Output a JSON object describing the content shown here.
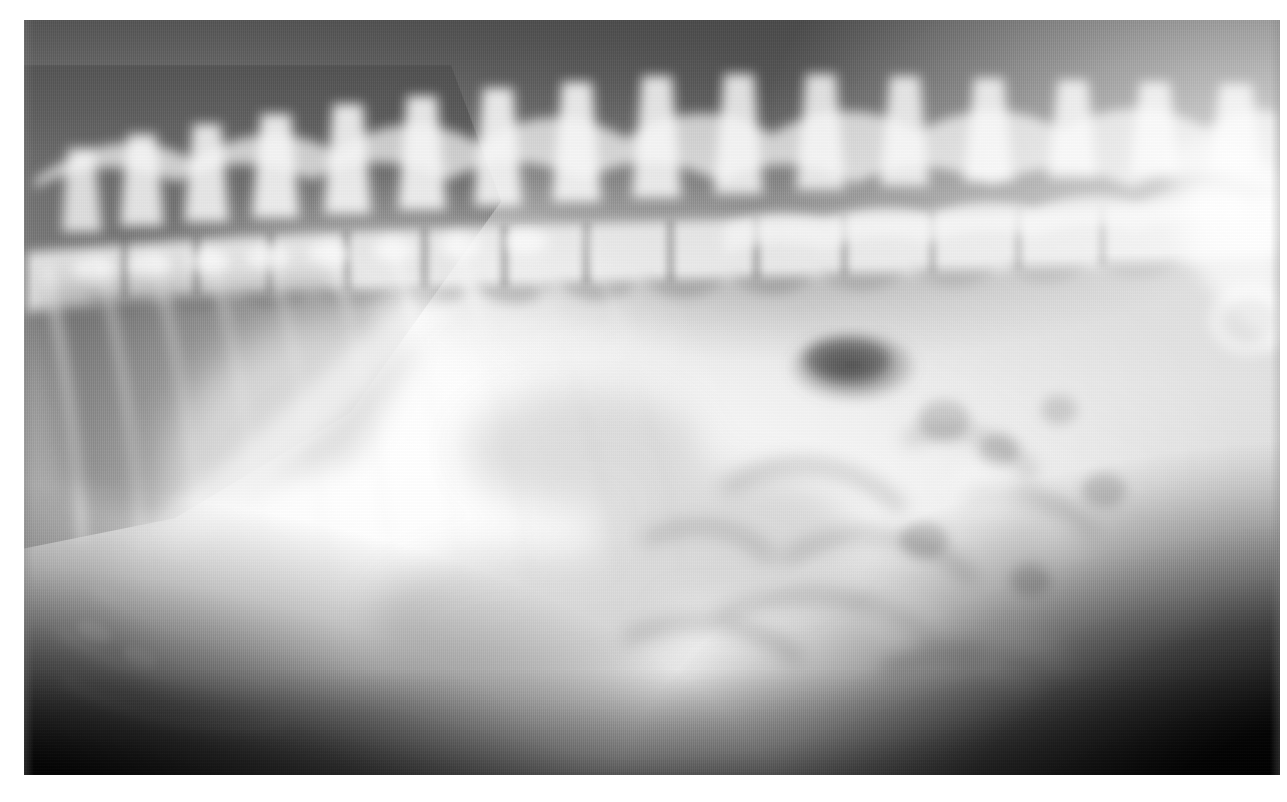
{
  "document": {
    "type": "radiograph",
    "modality": "X-ray",
    "view": "lateral",
    "region": "thoraco-abdominal",
    "subject": "small animal",
    "caption": "",
    "visible_text": []
  },
  "canvas": {
    "width_px": 1287,
    "height_px": 802,
    "background_color": "#ffffff"
  },
  "plate": {
    "left_px": 24,
    "top_px": 20,
    "width_px": 1256,
    "height_px": 755,
    "base_color": "#8e8e8e",
    "bright_color": "#e9e9e9",
    "dark_color": "#121212",
    "bone_color": "#fafafa"
  },
  "anatomy": {
    "structures": [
      {
        "name": "vertebral-column",
        "label": "thoracolumbar spine",
        "position": "dorsal, spanning full width"
      },
      {
        "name": "spinous-processes",
        "label": "dorsal spinous processes",
        "position": "dorsal ridge, scalloped"
      },
      {
        "name": "ribs",
        "label": "ribs",
        "position": "cranial third, oblique"
      },
      {
        "name": "diaphragm",
        "label": "diaphragm",
        "position": "left-of-centre, oblique dome"
      },
      {
        "name": "lung-field",
        "label": "caudal lung field",
        "position": "cranio-dorsal, radiolucent"
      },
      {
        "name": "liver",
        "label": "liver / cranial abdomen",
        "position": "cranioventral, opaque"
      },
      {
        "name": "stomach-gas-bubble",
        "label": "gas-filled viscus",
        "position": "mid-dorsal abdomen"
      },
      {
        "name": "intestinal-loops",
        "label": "intestinal loops",
        "position": "caudal abdomen"
      },
      {
        "name": "pelvis",
        "label": "pelvis / ilium",
        "position": "caudo-dorsal, highly opaque"
      },
      {
        "name": "sternum",
        "label": "sternum / costal arch",
        "position": "cranioventral"
      },
      {
        "name": "ventral-body-wall",
        "label": "ventral body wall",
        "position": "ventral margin"
      }
    ],
    "gas_bubble": {
      "center_x_pct": 66,
      "center_y_pct": 46,
      "radius_x_pct": 5.0,
      "radius_y_pct": 4.6,
      "opacity": 0.42
    },
    "vertebra_count": 17,
    "rib_count": 9
  },
  "margins": {
    "left_px": 24,
    "top_px": 20,
    "right_px": 7,
    "bottom_px": 27,
    "color": "#ffffff"
  }
}
